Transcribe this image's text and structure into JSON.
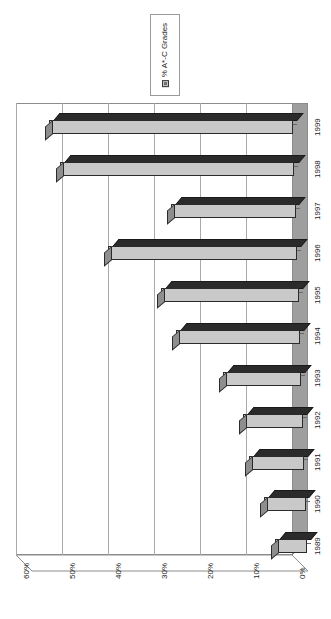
{
  "chart_data": {
    "type": "bar",
    "orientation": "horizontal-rotated",
    "title": "",
    "subtitle": "",
    "xlabel": "",
    "ylabel": "",
    "categories": [
      "1989",
      "1990",
      "1991",
      "1992",
      "1993",
      "1994",
      "1995",
      "1996",
      "1997",
      "1998",
      "1999"
    ],
    "series": [
      {
        "name": "% A*-C Grades",
        "values": [
          7,
          9,
          12,
          13,
          17,
          27,
          30,
          41,
          27,
          51,
          53
        ]
      }
    ],
    "value_ticks": [
      "60%",
      "50%",
      "40%",
      "30%",
      "20%",
      "10%",
      "0%"
    ],
    "value_tick_numbers": [
      60,
      50,
      40,
      30,
      20,
      10,
      0
    ],
    "ylim": [
      0,
      60
    ],
    "grid": true,
    "legend": {
      "position": "top-right",
      "entries": [
        {
          "label": "% A*-C Grades",
          "color": "#c8c8c8"
        }
      ]
    },
    "style": {
      "bar_face": "#c9c9c9",
      "bar_top": "#2b2b2b",
      "bar_side": "#8e8e8e",
      "outline": "#2b2b2b",
      "gridline": "#aaaaaa",
      "axis": "#8d8d8d",
      "background": "#ffffff",
      "text": "#1a1a1a"
    }
  }
}
